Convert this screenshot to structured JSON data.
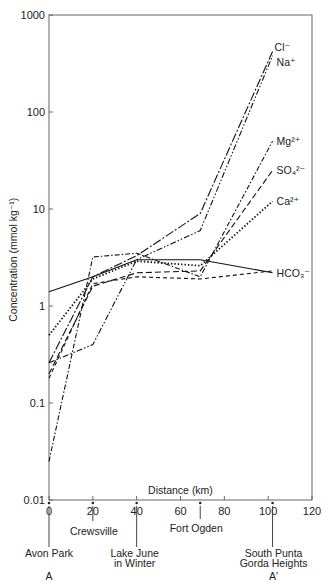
{
  "chart_data": {
    "type": "line",
    "title": "",
    "xlabel": "Distance (km)",
    "ylabel": "Concentration (mmol kg⁻¹)",
    "yscale": "log",
    "xlim": [
      0,
      120
    ],
    "ylim": [
      0.01,
      1000
    ],
    "x_ticks": [
      0,
      20,
      40,
      60,
      80,
      100,
      120
    ],
    "y_ticks": [
      "0.01",
      "0.1",
      "1",
      "10",
      "100",
      "1000"
    ],
    "grid": false,
    "legend_position": "inline labels at right end of each series",
    "locations": [
      {
        "name": "Avon Park",
        "km": 0
      },
      {
        "name": "Crewsville",
        "km": 20
      },
      {
        "name": "Lake June in Winter",
        "km": 40
      },
      {
        "name": "Fort Ogden",
        "km": 69
      },
      {
        "name": "South Punta Gorda Heights",
        "km": 102
      }
    ],
    "section_labels": {
      "start": "A",
      "end": "A′"
    },
    "x": [
      0,
      20,
      40,
      69,
      102
    ],
    "series": [
      {
        "name": "Cl−",
        "label": "Cl⁻",
        "style": "long-dash-dot",
        "values": [
          0.26,
          2.0,
          3.3,
          9.0,
          420
        ]
      },
      {
        "name": "Na+",
        "label": "Na⁺",
        "style": "dash-dot-dot",
        "values": [
          0.26,
          0.4,
          3.0,
          6.0,
          380
        ]
      },
      {
        "name": "Mg2+",
        "label": "Mg²⁺",
        "style": "dash-dot",
        "values": [
          0.025,
          3.2,
          3.5,
          2.0,
          50
        ]
      },
      {
        "name": "SO4 2−",
        "label": "SO₄²⁻",
        "style": "long-dash",
        "values": [
          0.2,
          1.6,
          2.2,
          2.3,
          25
        ]
      },
      {
        "name": "Ca2+",
        "label": "Ca²⁺",
        "style": "dotted",
        "values": [
          0.5,
          1.9,
          2.9,
          2.6,
          12
        ]
      },
      {
        "name": "HCO3−",
        "label": "HCO₃⁻",
        "style": "solid",
        "values": [
          1.4,
          2.0,
          3.0,
          3.0,
          2.2
        ]
      },
      {
        "name": "pre-SO4 dashed",
        "label": "",
        "style": "dashed",
        "values": [
          0.18,
          1.7,
          2.0,
          1.9,
          2.3
        ]
      }
    ]
  },
  "labels": {
    "ylabel": "Concentration (mmol kg⁻¹)",
    "xlabel": "Distance (km)",
    "loc_avon": "Avon Park",
    "loc_crews": "Crewsville",
    "loc_lake1": "Lake June",
    "loc_lake2": "in Winter",
    "loc_fort": "Fort Ogden",
    "loc_south1": "South Punta",
    "loc_south2": "Gorda Heights",
    "sec_a": "A",
    "sec_a2": "A′"
  }
}
